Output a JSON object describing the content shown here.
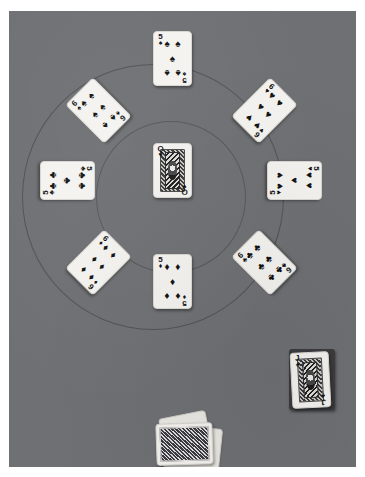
{
  "scene": {
    "title": "Playing cards arranged on a grey felt table",
    "surface_color": "#6e7073",
    "border_color": "#ffffff",
    "width": 365,
    "height": 477
  },
  "table_markings": [
    {
      "name": "outer-betting-circle",
      "shape": "circle"
    },
    {
      "name": "inner-betting-circle",
      "shape": "circle"
    }
  ],
  "cards": {
    "center": {
      "name": "queen-of-hearts",
      "rank": "Q",
      "suit": "hearts",
      "suit_glyph": "♥",
      "color": "#111111",
      "face_up": true,
      "type": "court",
      "position_label": "center"
    },
    "ring": [
      {
        "name": "five-of-spades",
        "rank": "5",
        "suit": "spades",
        "suit_glyph": "♠",
        "color": "#111111",
        "face_up": true,
        "type": "pip",
        "position_label": "top",
        "rotation_deg": 0
      },
      {
        "name": "six-of-hearts",
        "rank": "6",
        "suit": "hearts",
        "suit_glyph": "♥",
        "color": "#111111",
        "face_up": true,
        "type": "pip",
        "position_label": "top-right",
        "rotation_deg": 45
      },
      {
        "name": "five-of-hearts",
        "rank": "5",
        "suit": "hearts",
        "suit_glyph": "♥",
        "color": "#111111",
        "face_up": true,
        "type": "pip",
        "position_label": "right",
        "rotation_deg": 90
      },
      {
        "name": "six-of-clubs",
        "rank": "6",
        "suit": "clubs",
        "suit_glyph": "♣",
        "color": "#111111",
        "face_up": true,
        "type": "pip",
        "position_label": "bottom-right",
        "rotation_deg": -45
      },
      {
        "name": "five-of-diamonds",
        "rank": "5",
        "suit": "diamonds",
        "suit_glyph": "♦",
        "color": "#111111",
        "face_up": true,
        "type": "pip",
        "position_label": "bottom",
        "rotation_deg": 0
      },
      {
        "name": "six-of-diamonds",
        "rank": "6",
        "suit": "diamonds",
        "suit_glyph": "♦",
        "color": "#111111",
        "face_up": true,
        "type": "pip",
        "position_label": "bottom-left",
        "rotation_deg": 45
      },
      {
        "name": "five-of-clubs",
        "rank": "5",
        "suit": "clubs",
        "suit_glyph": "♣",
        "color": "#111111",
        "face_up": true,
        "type": "pip",
        "position_label": "left",
        "rotation_deg": 90
      },
      {
        "name": "six-of-spades",
        "rank": "6",
        "suit": "spades",
        "suit_glyph": "♠",
        "color": "#111111",
        "face_up": true,
        "type": "pip",
        "position_label": "top-left",
        "rotation_deg": -45
      }
    ],
    "deck_pile": {
      "name": "jack-of-spades-on-deck",
      "rank": "J",
      "suit": "spades",
      "suit_glyph": "♠",
      "color": "#111111",
      "face_up": true,
      "type": "court",
      "position_label": "lower-right",
      "rotation_deg": -3
    },
    "face_down_pile": {
      "name": "face-down-card",
      "face_up": false,
      "back_color": "#4a4a4e",
      "position_label": "bottom-center",
      "rotation_deg": -2
    }
  }
}
